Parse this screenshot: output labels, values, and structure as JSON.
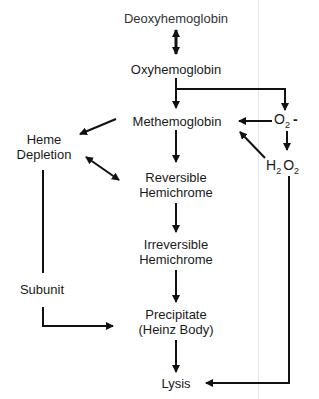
{
  "diagram": {
    "nodes": {
      "deoxyhemoglobin": "Deoxyhemoglobin",
      "oxyhemoglobin": "Oxyhemoglobin",
      "methemoglobin": "Methemoglobin",
      "superoxide": {
        "base": "O",
        "sub": "2",
        "sup": "-"
      },
      "hydrogen_peroxide": {
        "h": "H",
        "sub1": "2",
        "o": "O",
        "sub2": "2"
      },
      "heme_depletion": {
        "line1": "Heme",
        "line2": "Depletion"
      },
      "reversible_hemichrome": {
        "line1": "Reversible",
        "line2": "Hemichrome"
      },
      "irreversible_hemichrome": {
        "line1": "Irreversible",
        "line2": "Hemichrome"
      },
      "subunit": "Subunit",
      "precipitate": {
        "line1": "Precipitate",
        "line2": "(Heinz Body)"
      },
      "lysis": "Lysis"
    },
    "edges": [
      {
        "from": "Deoxyhemoglobin",
        "to": "Oxyhemoglobin",
        "type": "bidirectional"
      },
      {
        "from": "Oxyhemoglobin",
        "to": "Methemoglobin"
      },
      {
        "from": "Oxyhemoglobin",
        "to": "O2-"
      },
      {
        "from": "O2-",
        "to": "Methemoglobin"
      },
      {
        "from": "O2-",
        "to": "H2O2"
      },
      {
        "from": "H2O2",
        "to": "Methemoglobin"
      },
      {
        "from": "H2O2",
        "to": "Lysis"
      },
      {
        "from": "Methemoglobin",
        "to": "Heme Depletion"
      },
      {
        "from": "Methemoglobin",
        "to": "Reversible Hemichrome"
      },
      {
        "from": "Heme Depletion",
        "to": "Reversible Hemichrome",
        "type": "bidirectional"
      },
      {
        "from": "Reversible Hemichrome",
        "to": "Irreversible Hemichrome"
      },
      {
        "from": "Irreversible Hemichrome",
        "to": "Precipitate (Heinz Body)"
      },
      {
        "from": "Heme Depletion",
        "to": "Precipitate (Heinz Body)",
        "label": "Subunit"
      },
      {
        "from": "Precipitate (Heinz Body)",
        "to": "Lysis"
      }
    ]
  }
}
